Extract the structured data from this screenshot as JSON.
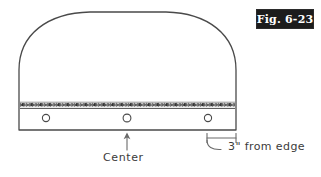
{
  "figure": {
    "plate_label": "Fig. 6-23",
    "ink_color": "#4a4a4a",
    "plate_background": "#1c1c1c",
    "plate_text_color": "#ffffff",
    "background": "#ffffff"
  },
  "annotations": [
    {
      "name": "center",
      "text": "Center",
      "pointer": "arrow-up"
    },
    {
      "name": "edge-distance",
      "text": "3\" from edge",
      "pointer": "curved-leader"
    }
  ],
  "drawing": {
    "description": "Dome-topped fabric panel with stitched hem band and three grommet holes",
    "outline": {
      "left_x": 19,
      "right_x": 236,
      "bottom_y": 130,
      "top_y": 12,
      "corner_radius": 58
    },
    "stitch_band": {
      "y": 105,
      "left_x": 20,
      "right_x": 235,
      "label": "stitched seam"
    },
    "holes": [
      {
        "name": "hole-left",
        "cx": 46,
        "cy": 118,
        "r": 3.6
      },
      {
        "name": "hole-center",
        "cx": 127,
        "cy": 118,
        "r": 3.9
      },
      {
        "name": "hole-right",
        "cx": 208,
        "cy": 118,
        "r": 3.6
      }
    ],
    "dimension_bracket": {
      "y": 138,
      "left_x": 207,
      "right_x": 236,
      "tick_height": 5
    },
    "center_arrow": {
      "x": 127,
      "from_y": 150,
      "to_y": 133
    }
  }
}
